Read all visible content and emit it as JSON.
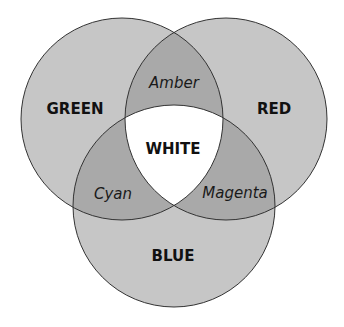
{
  "diagram": {
    "type": "venn",
    "colors": {
      "background": "#ffffff",
      "single_fill": "#c6c6c6",
      "double_fill": "#a9a9a9",
      "triple_fill": "#ffffff",
      "stroke": "#333333"
    },
    "circles": [
      {
        "id": "green",
        "label": "GREEN",
        "cx": 122,
        "cy": 119,
        "r": 101,
        "label_x": 75,
        "label_y": 114
      },
      {
        "id": "red",
        "label": "RED",
        "cx": 226,
        "cy": 119,
        "r": 101,
        "label_x": 274,
        "label_y": 114
      },
      {
        "id": "blue",
        "label": "BLUE",
        "cx": 174,
        "cy": 206,
        "r": 101,
        "label_x": 173,
        "label_y": 261
      }
    ],
    "intersections": [
      {
        "sets": [
          "green",
          "red"
        ],
        "label": "Amber",
        "label_x": 174,
        "label_y": 88
      },
      {
        "sets": [
          "green",
          "blue"
        ],
        "label": "Cyan",
        "label_x": 113,
        "label_y": 199
      },
      {
        "sets": [
          "red",
          "blue"
        ],
        "label": "Magenta",
        "label_x": 235,
        "label_y": 198
      },
      {
        "sets": [
          "green",
          "red",
          "blue"
        ],
        "label": "WHITE",
        "label_x": 173,
        "label_y": 154
      }
    ]
  }
}
